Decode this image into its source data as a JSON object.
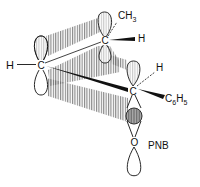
{
  "diagram": {
    "type": "orbital-overlap",
    "atoms": {
      "left_carbon": "C",
      "left_h": "H",
      "top_carbon": "C",
      "top_methyl": "CH",
      "top_methyl_sub": "3",
      "top_h": "H",
      "right_carbon": "C",
      "right_h": "H",
      "phenyl_c": "C",
      "phenyl_c_sub": "6",
      "phenyl_h": "H",
      "phenyl_h_sub": "5",
      "oxygen": "O",
      "leaving_group": "PNB"
    },
    "colors": {
      "line": "#111111",
      "hatch": "#777777",
      "shade": "#999999"
    }
  }
}
